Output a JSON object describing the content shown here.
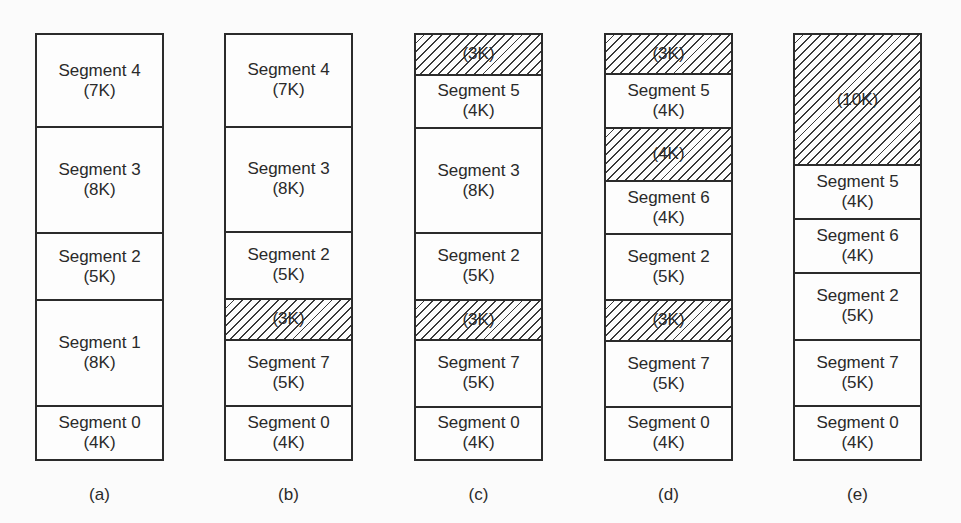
{
  "figure": {
    "unit_px_per_k": 13.375,
    "columns": [
      {
        "id": "a",
        "label": "(a)",
        "segments": [
          {
            "name": "Segment 4",
            "size": "(7K)",
            "k": 7,
            "hole": false
          },
          {
            "name": "Segment 3",
            "size": "(8K)",
            "k": 8,
            "hole": false
          },
          {
            "name": "Segment 2",
            "size": "(5K)",
            "k": 5,
            "hole": false
          },
          {
            "name": "Segment 1",
            "size": "(8K)",
            "k": 8,
            "hole": false
          },
          {
            "name": "Segment 0",
            "size": "(4K)",
            "k": 4,
            "hole": false
          }
        ]
      },
      {
        "id": "b",
        "label": "(b)",
        "segments": [
          {
            "name": "Segment 4",
            "size": "(7K)",
            "k": 7,
            "hole": false
          },
          {
            "name": "Segment 3",
            "size": "(8K)",
            "k": 8,
            "hole": false
          },
          {
            "name": "Segment 2",
            "size": "(5K)",
            "k": 5,
            "hole": false
          },
          {
            "name": "",
            "size": "(3K)",
            "k": 3,
            "hole": true
          },
          {
            "name": "Segment 7",
            "size": "(5K)",
            "k": 5,
            "hole": false
          },
          {
            "name": "Segment 0",
            "size": "(4K)",
            "k": 4,
            "hole": false
          }
        ]
      },
      {
        "id": "c",
        "label": "(c)",
        "segments": [
          {
            "name": "",
            "size": "(3K)",
            "k": 3,
            "hole": true
          },
          {
            "name": "Segment 5",
            "size": "(4K)",
            "k": 4,
            "hole": false
          },
          {
            "name": "Segment 3",
            "size": "(8K)",
            "k": 8,
            "hole": false
          },
          {
            "name": "Segment 2",
            "size": "(5K)",
            "k": 5,
            "hole": false
          },
          {
            "name": "",
            "size": "(3K)",
            "k": 3,
            "hole": true
          },
          {
            "name": "Segment 7",
            "size": "(5K)",
            "k": 5,
            "hole": false
          },
          {
            "name": "Segment 0",
            "size": "(4K)",
            "k": 4,
            "hole": false
          }
        ]
      },
      {
        "id": "d",
        "label": "(d)",
        "segments": [
          {
            "name": "",
            "size": "(3K)",
            "k": 3,
            "hole": true
          },
          {
            "name": "Segment 5",
            "size": "(4K)",
            "k": 4,
            "hole": false
          },
          {
            "name": "",
            "size": "(4K)",
            "k": 4,
            "hole": true
          },
          {
            "name": "Segment 6",
            "size": "(4K)",
            "k": 4,
            "hole": false
          },
          {
            "name": "Segment 2",
            "size": "(5K)",
            "k": 5,
            "hole": false
          },
          {
            "name": "",
            "size": "(3K)",
            "k": 3,
            "hole": true
          },
          {
            "name": "Segment 7",
            "size": "(5K)",
            "k": 5,
            "hole": false
          },
          {
            "name": "Segment 0",
            "size": "(4K)",
            "k": 4,
            "hole": false
          }
        ]
      },
      {
        "id": "e",
        "label": "(e)",
        "segments": [
          {
            "name": "",
            "size": "(10K)",
            "k": 10,
            "hole": true
          },
          {
            "name": "Segment 5",
            "size": "(4K)",
            "k": 4,
            "hole": false
          },
          {
            "name": "Segment 6",
            "size": "(4K)",
            "k": 4,
            "hole": false
          },
          {
            "name": "Segment 2",
            "size": "(5K)",
            "k": 5,
            "hole": false
          },
          {
            "name": "Segment 7",
            "size": "(5K)",
            "k": 5,
            "hole": false
          },
          {
            "name": "Segment 0",
            "size": "(4K)",
            "k": 4,
            "hole": false
          }
        ]
      }
    ]
  }
}
